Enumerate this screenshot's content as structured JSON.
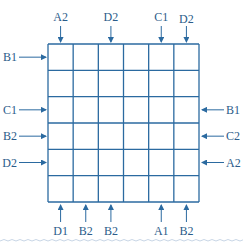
{
  "colors": {
    "line": "#2b6aa0",
    "text": "#2b5c8a",
    "wave": "#c8d6e6"
  },
  "grid": {
    "rows": 6,
    "cols": 6,
    "left": 48,
    "top": 44,
    "right": 199,
    "bottom": 202
  },
  "top_labels": [
    {
      "col": 0,
      "text": "A2"
    },
    {
      "col": 2,
      "text": "D2"
    },
    {
      "col": 4,
      "text": "C1"
    },
    {
      "col": 5,
      "text": "D2"
    }
  ],
  "bottom_labels": [
    {
      "col": 0,
      "text": "D1"
    },
    {
      "col": 1,
      "text": "B2"
    },
    {
      "col": 2,
      "text": "B2"
    },
    {
      "col": 4,
      "text": "A1"
    },
    {
      "col": 5,
      "text": "B2"
    }
  ],
  "left_labels": [
    {
      "row": 0,
      "text": "B1"
    },
    {
      "row": 2,
      "text": "C1"
    },
    {
      "row": 3,
      "text": "B2"
    },
    {
      "row": 4,
      "text": "D2"
    }
  ],
  "right_labels": [
    {
      "row": 2,
      "text": "B1"
    },
    {
      "row": 3,
      "text": "C2"
    },
    {
      "row": 4,
      "text": "A2"
    }
  ]
}
